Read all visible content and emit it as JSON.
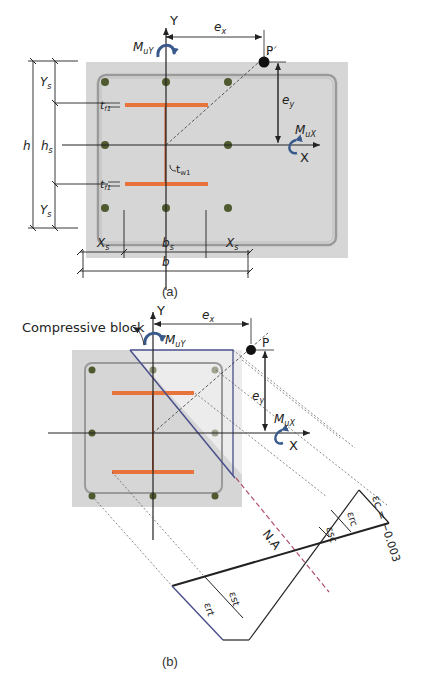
{
  "colors": {
    "concrete": "#d6d6d6",
    "concrete_light": "#eeeeee",
    "steel_flange": "#e8743b",
    "steel_web": "#c2502a",
    "rebar": "#4f5a2e",
    "moment_arrow": "#3a5a8c",
    "neutral_axis": "#b0506a",
    "compression_outline": "#4a4f8a",
    "line": "#222222"
  },
  "figure_a": {
    "caption": "(a)",
    "axis_x_label": "X",
    "axis_y_label": "Y",
    "moment_x_label": "M",
    "moment_x_sub": "uX",
    "moment_y_label": "M",
    "moment_y_sub": "uY",
    "load_point_label": "P",
    "ecc_x_label": "e",
    "ecc_x_sub": "x",
    "ecc_y_label": "e",
    "ecc_y_sub": "y",
    "dim_h": "h",
    "dim_hs": "h",
    "dim_hs_sub": "s",
    "dim_Ys_top": "Y",
    "dim_Ys_top_sub": "s",
    "dim_Ys_bottom": "Y",
    "dim_Ys_bottom_sub": "s",
    "dim_b": "b",
    "dim_bs": "b",
    "dim_bs_sub": "s",
    "dim_Xs_left": "X",
    "dim_Xs_left_sub": "s",
    "dim_Xs_right": "X",
    "dim_Xs_right_sub": "s",
    "flange_thickness_top": "t",
    "flange_thickness_top_sub": "f1",
    "flange_thickness_bottom": "t",
    "flange_thickness_bottom_sub": "f1",
    "web_thickness": "t",
    "web_thickness_sub": "w1"
  },
  "figure_b": {
    "caption": "(b)",
    "compressive_block_label": "Compressive block",
    "axis_x_label": "X",
    "axis_y_label": "Y",
    "moment_x_label": "M",
    "moment_x_sub": "uX",
    "moment_y_label": "M",
    "moment_y_sub": "uY",
    "load_point_label": "P",
    "ecc_x_label": "e",
    "ecc_x_sub": "x",
    "ecc_y_label": "e",
    "ecc_y_sub": "y",
    "neutral_axis_label": "N.A",
    "strain_concrete": "εc = −0.003",
    "strain_rc": "εrc",
    "strain_sc": "εsc",
    "strain_st": "εst",
    "strain_rt": "εrt"
  }
}
